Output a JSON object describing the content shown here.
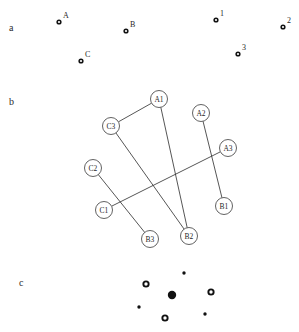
{
  "figure": {
    "background_color": "#ffffff",
    "ink_color": "#1f1f1f",
    "width": 299,
    "height": 332
  },
  "panels": {
    "a": {
      "label": "a",
      "label_pos": {
        "x": 9,
        "y": 23
      },
      "marker_style": "open-ring",
      "markers": [
        {
          "name": "marker-a-A",
          "label": "A",
          "x": 59,
          "y": 22,
          "label_dx": 4,
          "label_dy": -4
        },
        {
          "name": "marker-a-B",
          "label": "B",
          "x": 126,
          "y": 31,
          "label_dx": 4,
          "label_dy": -4
        },
        {
          "name": "marker-a-C",
          "label": "C",
          "x": 81,
          "y": 61,
          "label_dx": 4,
          "label_dy": -4
        },
        {
          "name": "marker-a-1",
          "label": "1",
          "x": 216,
          "y": 20,
          "label_dx": 4,
          "label_dy": -4
        },
        {
          "name": "marker-a-2",
          "label": "2",
          "x": 283,
          "y": 27,
          "label_dx": 4,
          "label_dy": -4
        },
        {
          "name": "marker-a-3",
          "label": "3",
          "x": 238,
          "y": 54,
          "label_dx": 4,
          "label_dy": -4
        }
      ]
    },
    "b": {
      "label": "b",
      "label_pos": {
        "x": 9,
        "y": 97
      },
      "node_radius": 8.5,
      "nodes": [
        {
          "name": "node-A1",
          "label": "A1",
          "x": 159,
          "y": 99
        },
        {
          "name": "node-A2",
          "label": "A2",
          "x": 201,
          "y": 113
        },
        {
          "name": "node-A3",
          "label": "A3",
          "x": 228,
          "y": 148
        },
        {
          "name": "node-B1",
          "label": "B1",
          "x": 224,
          "y": 206
        },
        {
          "name": "node-B2",
          "label": "B2",
          "x": 189,
          "y": 236
        },
        {
          "name": "node-B3",
          "label": "B3",
          "x": 150,
          "y": 239
        },
        {
          "name": "node-C1",
          "label": "C1",
          "x": 104,
          "y": 210
        },
        {
          "name": "node-C2",
          "label": "C2",
          "x": 93,
          "y": 168
        },
        {
          "name": "node-C3",
          "label": "C3",
          "x": 111,
          "y": 126
        }
      ],
      "edges": [
        {
          "name": "edge-C3-A1",
          "from": "C3",
          "to": "A1"
        },
        {
          "name": "edge-A1-B2",
          "from": "A1",
          "to": "B2"
        },
        {
          "name": "edge-C3-B2",
          "from": "C3",
          "to": "B2"
        },
        {
          "name": "edge-A2-B1",
          "from": "A2",
          "to": "B1"
        },
        {
          "name": "edge-A3-C1",
          "from": "A3",
          "to": "C1"
        },
        {
          "name": "edge-C2-B3",
          "from": "C2",
          "to": "B3"
        }
      ]
    },
    "c": {
      "label": "c",
      "label_pos": {
        "x": 19,
        "y": 278
      },
      "rings": [
        {
          "name": "marker-c-ring-1",
          "x": 146,
          "y": 284,
          "r": 3.6
        },
        {
          "name": "marker-c-ring-2",
          "x": 211,
          "y": 292,
          "r": 3.6
        },
        {
          "name": "marker-c-ring-3",
          "x": 165,
          "y": 318,
          "r": 3.6
        }
      ],
      "dots": [
        {
          "name": "marker-c-dot-1",
          "x": 184,
          "y": 273,
          "r": 1.7
        },
        {
          "name": "marker-c-dot-2",
          "x": 139,
          "y": 307,
          "r": 1.7
        },
        {
          "name": "marker-c-dot-3",
          "x": 205,
          "y": 314,
          "r": 1.7
        }
      ],
      "filled": [
        {
          "name": "marker-c-filled-1",
          "x": 172,
          "y": 295,
          "r": 4.2
        }
      ]
    }
  },
  "chart_data": {
    "type": "scatter",
    "title": "",
    "xlabel": "",
    "ylabel": "",
    "grid": false,
    "legend": "none",
    "panel_labels": [
      "a",
      "b",
      "c"
    ],
    "series": [
      {
        "name": "panel-a-left-group",
        "panel": "a",
        "marker": "open-ring",
        "point_labels": [
          "A",
          "B",
          "C"
        ],
        "x": [
          59,
          126,
          81
        ],
        "y": [
          22,
          31,
          61
        ]
      },
      {
        "name": "panel-a-right-group",
        "panel": "a",
        "marker": "open-ring",
        "point_labels": [
          "1",
          "2",
          "3"
        ],
        "x": [
          216,
          283,
          238
        ],
        "y": [
          20,
          27,
          54
        ]
      },
      {
        "name": "panel-b-nodes",
        "panel": "b",
        "marker": "circled-label",
        "point_labels": [
          "A1",
          "A2",
          "A3",
          "B1",
          "B2",
          "B3",
          "C1",
          "C2",
          "C3"
        ],
        "x": [
          159,
          201,
          228,
          224,
          189,
          150,
          104,
          93,
          111
        ],
        "y": [
          99,
          113,
          148,
          206,
          236,
          239,
          210,
          168,
          126
        ]
      },
      {
        "name": "panel-b-edges",
        "panel": "b",
        "marker": "line",
        "edges": [
          [
            "C3",
            "A1"
          ],
          [
            "A1",
            "B2"
          ],
          [
            "C3",
            "B2"
          ],
          [
            "A2",
            "B1"
          ],
          [
            "A3",
            "C1"
          ],
          [
            "C2",
            "B3"
          ]
        ]
      },
      {
        "name": "panel-c-rings",
        "panel": "c",
        "marker": "open-ring",
        "x": [
          146,
          211,
          165
        ],
        "y": [
          284,
          292,
          318
        ]
      },
      {
        "name": "panel-c-dots",
        "panel": "c",
        "marker": "small-dot",
        "x": [
          184,
          139,
          205
        ],
        "y": [
          273,
          307,
          314
        ]
      },
      {
        "name": "panel-c-filled",
        "panel": "c",
        "marker": "large-filled-dot",
        "x": [
          172
        ],
        "y": [
          295
        ]
      }
    ]
  }
}
